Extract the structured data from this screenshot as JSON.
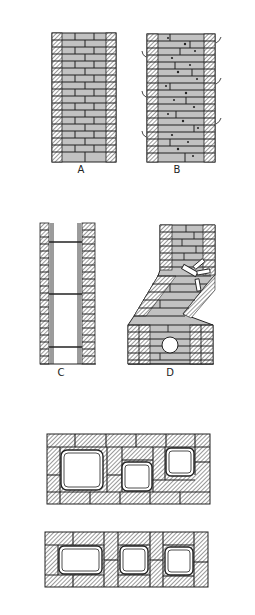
{
  "figure": {
    "panels": [
      {
        "id": "A",
        "label": "A",
        "description": "Brick chimney wall in elevation with hatched outer bricks and solid brick courses"
      },
      {
        "id": "B",
        "label": "B",
        "description": "Brick chimney wall with cracked/deteriorated mortar joints and curved crack marks on sides"
      },
      {
        "id": "C",
        "label": "C",
        "description": "Chimney section showing flue liner sections between hatched brick walls"
      },
      {
        "id": "D",
        "label": "D",
        "description": "Leaning/offset chimney with displaced bricks and round thimble opening"
      }
    ],
    "plans": [
      {
        "id": "plan-1",
        "description": "Plan view of chimney with three flue liners of differing sizes, staggered bond"
      },
      {
        "id": "plan-2",
        "description": "Plan view of chimney with three flue liners separated by wythe walls"
      }
    ]
  },
  "colors": {
    "line": "#222222",
    "brick_fill": "#bdbdbd",
    "hatch": "#555555",
    "background": "#ffffff"
  }
}
